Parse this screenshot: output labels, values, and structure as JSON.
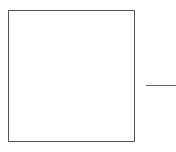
{
  "diagram": {
    "shapes": [
      {
        "type": "rectangle",
        "role": "box",
        "stroke_color": "#555555",
        "fill_color": "#ffffff",
        "label": ""
      },
      {
        "type": "line",
        "role": "connector",
        "orientation": "horizontal",
        "stroke_color": "#6a6a6a",
        "label": ""
      }
    ],
    "background_color": "#ffffff"
  }
}
